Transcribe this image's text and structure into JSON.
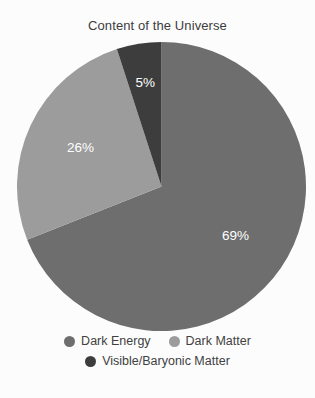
{
  "chart_data": {
    "type": "pie",
    "title": "Content of the Universe",
    "categories": [
      "Dark Energy",
      "Dark Matter",
      "Visible/Baryonic Matter"
    ],
    "values": [
      69,
      26,
      5
    ],
    "value_labels": [
      "69%",
      "26%",
      "5%"
    ],
    "unit": "%",
    "colors": [
      "#6e6e6e",
      "#9c9c9c",
      "#3d3d3d"
    ],
    "start_angle_deg": 0,
    "direction": "clockwise",
    "legend_position": "bottom",
    "grid": false,
    "xlabel": "",
    "ylabel": ""
  },
  "legend": {
    "rows": [
      [
        {
          "label": "Dark Energy",
          "color": "#6e6e6e"
        },
        {
          "label": "Dark Matter",
          "color": "#9c9c9c"
        }
      ],
      [
        {
          "label": "Visible/Baryonic Matter",
          "color": "#3d3d3d"
        }
      ]
    ]
  },
  "background_color": "#fcfcfc",
  "title_color": "#3c3c3c",
  "label_color": "#ffffff"
}
